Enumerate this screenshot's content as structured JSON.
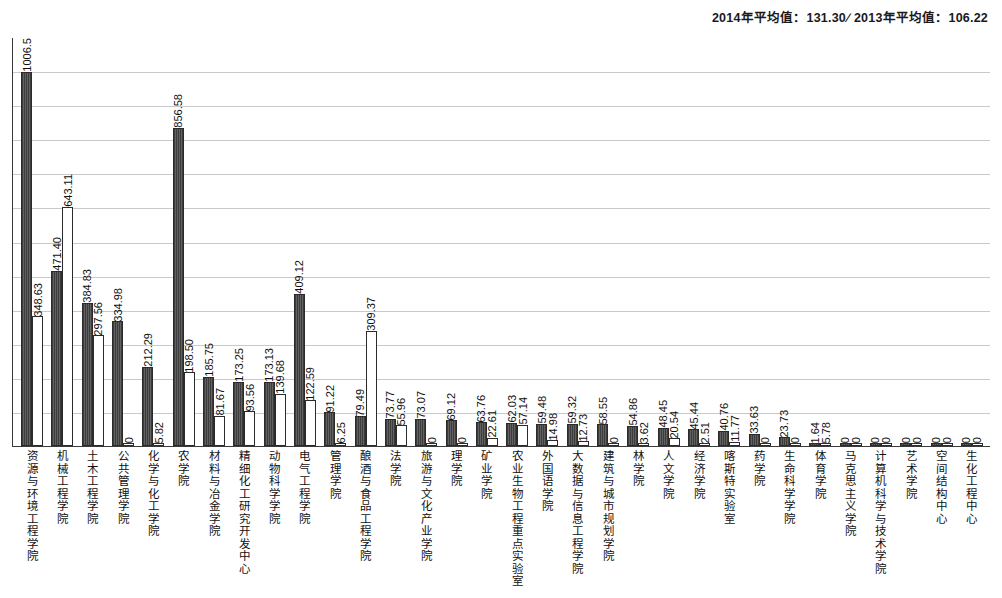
{
  "header": {
    "mean_2014_label": "2014年平均值：131.30",
    "separator": "∕",
    "mean_2013_label": "2013年平均值：106.22",
    "mean_2014_value": 131.3,
    "mean_2013_value": 106.22
  },
  "chart_data": {
    "type": "bar",
    "title": "",
    "xlabel": "",
    "ylabel": "",
    "grid": true,
    "gridlines": 11,
    "ylim": [
      0,
      1100
    ],
    "legend_position": "none",
    "annotations": [
      "2014年平均值：131.30",
      "2013年平均值：106.22"
    ],
    "categories": [
      "资源与环境工程学院",
      "机械工程学院",
      "土木工程学院",
      "公共管理学院",
      "化学与化工学院",
      "农学院",
      "材料与冶金学院",
      "精细化工研究开发中心",
      "动物科学学院",
      "电气工程学院",
      "管理学院",
      "酿酒与食品工程学院",
      "法学院",
      "旅游与文化产业学院",
      "理学院",
      "矿业学院",
      "农业生物工程重点实验室",
      "外国语学院",
      "大数据与信息工程学院",
      "建筑与城市规划学院",
      "林学院",
      "人文学院",
      "经济学院",
      "喀斯特实验室",
      "药学院",
      "生命科学学院",
      "体育学院",
      "马克思主义学院",
      "计算机科学与技术学院",
      "艺术学院",
      "空间结构中心",
      "生化工程中心"
    ],
    "series": [
      {
        "name": "2014",
        "values": [
          1006.5,
          471.4,
          384.83,
          334.98,
          212.29,
          856.58,
          185.75,
          173.25,
          173.13,
          409.12,
          91.22,
          79.49,
          73.77,
          73.07,
          69.12,
          63.76,
          62.03,
          59.48,
          59.32,
          58.55,
          54.86,
          48.45,
          45.44,
          40.76,
          33.63,
          23.73,
          1.64,
          0,
          0,
          0,
          0,
          0
        ],
        "labels": [
          "1006.5",
          "471.40",
          "384.83",
          "334.98",
          "212.29",
          "856.58",
          "185.75",
          "173.25",
          "173.13",
          "409.12",
          "91.22",
          "79.49",
          "73.77",
          "73.07",
          "69.12",
          "63.76",
          "62.03",
          "59.48",
          "59.32",
          "58.55",
          "54.86",
          "48.45",
          "45.44",
          "40.76",
          "33.63",
          "23.73",
          "1.64",
          "0",
          "0",
          "0",
          "0",
          "0"
        ]
      },
      {
        "name": "2013",
        "values": [
          348.63,
          643.11,
          297.56,
          0,
          5.82,
          198.5,
          81.67,
          93.56,
          139.68,
          122.59,
          6.25,
          309.37,
          55.96,
          0,
          0,
          22.61,
          57.14,
          14.98,
          12.73,
          0,
          3.62,
          20.54,
          2.51,
          11.77,
          0,
          0,
          5.78,
          0,
          0,
          0,
          0,
          0
        ],
        "labels": [
          "348.63",
          "643.11",
          "297.56",
          "0",
          "5.82",
          "198.50",
          "81.67",
          "93.56",
          "139.68",
          "122.59",
          "6.25",
          "309.37",
          "55.96",
          "0",
          "0",
          "22.61",
          "57.14",
          "14.98",
          "12.73",
          "0",
          "3.62",
          "20.54",
          "2.51",
          "11.77",
          "0",
          "0",
          "5.78",
          "0",
          "0",
          "0",
          "0",
          "0"
        ]
      }
    ]
  },
  "colors": {
    "series_2014": "#4a4a4a",
    "series_2013": "#ffffff",
    "axis": "#3a3a3a",
    "gridline": "#c9c9c9",
    "text": "#111111"
  }
}
